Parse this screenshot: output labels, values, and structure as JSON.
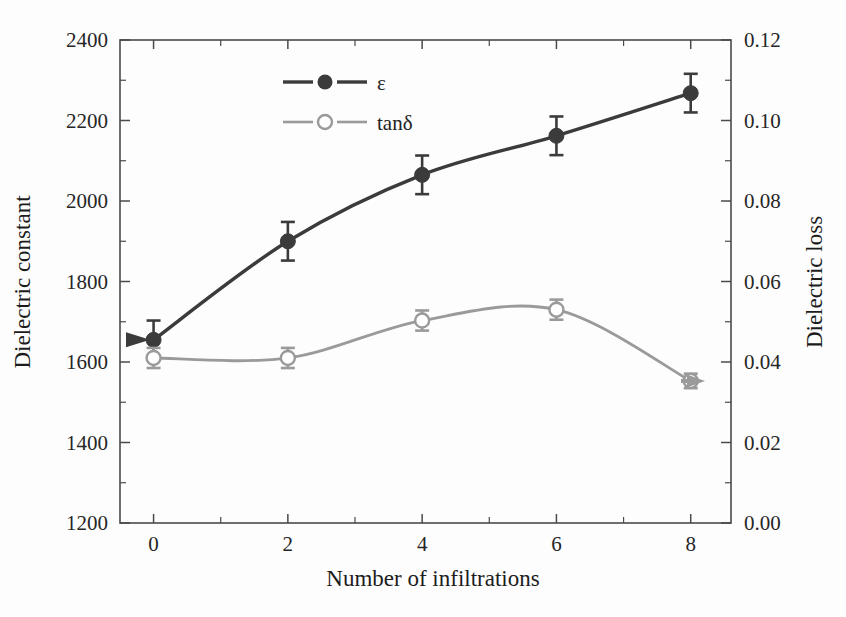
{
  "figure": {
    "background_color": "#fdfdfd",
    "frame_color": "#4a4a4a"
  },
  "colors": {
    "epsilon_series": "#3b3b3b",
    "tand_series": "#9a9a9a",
    "axis": "#4a4a4a",
    "text": "#1c1c1c",
    "arrow_left": "#3b3b3b",
    "arrow_right": "#9a9a9a"
  },
  "axes": {
    "x": {
      "label": "Number of infiltrations",
      "ticks": [
        "0",
        "2",
        "4",
        "6",
        "8"
      ],
      "tick_values": [
        0,
        2,
        4,
        6,
        8
      ],
      "min": -0.5,
      "max": 8.6
    },
    "y_left": {
      "label": "Dielectric constant",
      "ticks": [
        "1200",
        "1400",
        "1600",
        "1800",
        "2000",
        "2200",
        "2400"
      ],
      "tick_values": [
        1200,
        1400,
        1600,
        1800,
        2000,
        2200,
        2400
      ],
      "min": 1200,
      "max": 2400,
      "minor_step": 100
    },
    "y_right": {
      "label": "Dielectric loss",
      "ticks": [
        "0.00",
        "0.02",
        "0.04",
        "0.06",
        "0.08",
        "0.10",
        "0.12"
      ],
      "tick_values": [
        0.0,
        0.02,
        0.04,
        0.06,
        0.08,
        0.1,
        0.12
      ],
      "min": 0.0,
      "max": 0.12,
      "minor_step": 0.01
    }
  },
  "legend": {
    "entries": [
      {
        "label": "ε",
        "marker": "filled-circle",
        "color": "#3b3b3b"
      },
      {
        "label": "tanδ",
        "marker": "open-circle",
        "color": "#9a9a9a"
      }
    ]
  },
  "annotations": [
    {
      "name": "left-arrow-to-epsilon",
      "glyph": "◀",
      "points_to": "epsilon",
      "axis": "y_left"
    },
    {
      "name": "right-arrow-to-tand",
      "glyph": "▶",
      "points_to": "tand",
      "axis": "y_right"
    }
  ],
  "chart_data": {
    "type": "line",
    "title": "",
    "xlabel": "Number of infiltrations",
    "ylabel": "Dielectric constant",
    "ylabel_secondary": "Dielectric loss",
    "x": [
      0,
      2,
      4,
      6,
      8
    ],
    "xlim": [
      -0.5,
      8.6
    ],
    "ylim": [
      1200,
      2400
    ],
    "ylim_secondary": [
      0.0,
      0.12
    ],
    "grid": false,
    "legend_position": "top-center",
    "series": [
      {
        "name": "ε",
        "axis": "left",
        "marker": "filled-circle",
        "color": "#3b3b3b",
        "values": [
          1655,
          1900,
          2065,
          2162,
          2268
        ],
        "errors": [
          48,
          48,
          48,
          48,
          48
        ]
      },
      {
        "name": "tanδ",
        "axis": "right",
        "marker": "open-circle",
        "color": "#9a9a9a",
        "values": [
          0.041,
          0.041,
          0.0503,
          0.053,
          0.0353
        ],
        "errors": [
          0.0025,
          0.0025,
          0.0025,
          0.0025,
          0.0018
        ]
      }
    ]
  }
}
